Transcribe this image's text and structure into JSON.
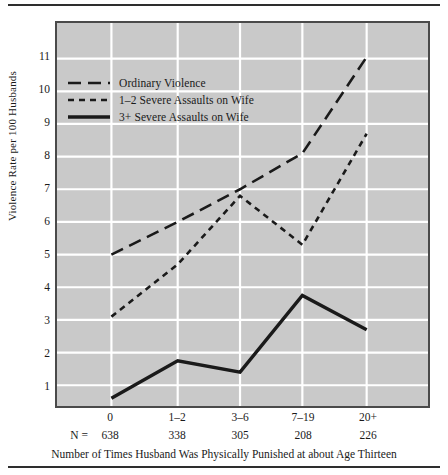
{
  "chart_data": {
    "type": "line",
    "title": "",
    "xlabel": "Number of Times Husband Was Physically Punished at about Age Thirteen",
    "ylabel": "Violence Rate per 100 Husbands",
    "categories": [
      "0",
      "1–2",
      "3–6",
      "7–19",
      "20+"
    ],
    "n_prefix": "N =",
    "n_values": [
      638,
      338,
      305,
      208,
      226
    ],
    "ylim": [
      0,
      11.7
    ],
    "yticks": [
      1,
      2,
      3,
      4,
      5,
      6,
      7,
      8,
      9,
      10,
      11
    ],
    "ytick_labels": [
      "1",
      "2",
      "3",
      "4",
      "5",
      "6",
      "7",
      "8",
      "9",
      "10",
      "11"
    ],
    "grid": true,
    "legend_position": "upper-left",
    "series": [
      {
        "name": "Ordinary Violence",
        "style": "long-dash",
        "color": "#1a1a1a",
        "values": [
          5.0,
          6.0,
          7.0,
          8.1,
          11.05
        ]
      },
      {
        "name": "1–2 Severe Assaults on Wife",
        "style": "short-dash",
        "color": "#1a1a1a",
        "values": [
          3.1,
          4.7,
          6.8,
          5.3,
          8.7
        ]
      },
      {
        "name": "3+ Severe Assaults on Wife",
        "style": "solid",
        "color": "#1a1a1a",
        "values": [
          0.6,
          1.75,
          1.4,
          3.75,
          2.7
        ]
      }
    ]
  },
  "colors": {
    "plot_background": "#c9c9c9",
    "grid_line": "#ffffff",
    "plot_border": "#4a4a4a",
    "ink": "#1a1a1a",
    "rule": "#2e2e2e",
    "page_background": "#ffffff"
  }
}
